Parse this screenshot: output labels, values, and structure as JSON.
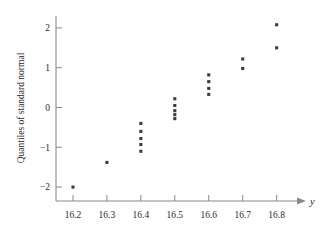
{
  "chart_data": {
    "type": "scatter",
    "title": "",
    "subtitle": "",
    "xlabel": "y",
    "ylabel": "Quantiles of standard normal",
    "xlim": [
      16.15,
      16.86
    ],
    "ylim": [
      -2.35,
      2.3
    ],
    "grid": false,
    "legend": null,
    "x_ticks": [
      16.2,
      16.3,
      16.4,
      16.5,
      16.6,
      16.7,
      16.8
    ],
    "x_tick_labels": [
      "16.2",
      "16.3",
      "16.4",
      "16.5",
      "16.6",
      "16.7",
      "16.8"
    ],
    "y_ticks": [
      -2,
      -1,
      0,
      1,
      2
    ],
    "y_tick_labels": [
      "-2",
      "-1",
      "0",
      "1",
      "2"
    ],
    "marker": "filled-square",
    "marker_color": "#3b3b3b",
    "axis_color": "#8a8a8a",
    "x_axis_arrow": true,
    "points": [
      {
        "x": 16.2,
        "y": -2.0
      },
      {
        "x": 16.3,
        "y": -1.38
      },
      {
        "x": 16.4,
        "y": -0.4
      },
      {
        "x": 16.4,
        "y": -0.6
      },
      {
        "x": 16.4,
        "y": -0.78
      },
      {
        "x": 16.4,
        "y": -0.93
      },
      {
        "x": 16.4,
        "y": -1.1
      },
      {
        "x": 16.5,
        "y": 0.22
      },
      {
        "x": 16.5,
        "y": 0.05
      },
      {
        "x": 16.5,
        "y": -0.08
      },
      {
        "x": 16.5,
        "y": -0.18
      },
      {
        "x": 16.5,
        "y": -0.28
      },
      {
        "x": 16.6,
        "y": 0.82
      },
      {
        "x": 16.6,
        "y": 0.65
      },
      {
        "x": 16.6,
        "y": 0.48
      },
      {
        "x": 16.6,
        "y": 0.33
      },
      {
        "x": 16.7,
        "y": 1.22
      },
      {
        "x": 16.7,
        "y": 0.98
      },
      {
        "x": 16.8,
        "y": 2.08
      },
      {
        "x": 16.8,
        "y": 1.5
      }
    ]
  }
}
